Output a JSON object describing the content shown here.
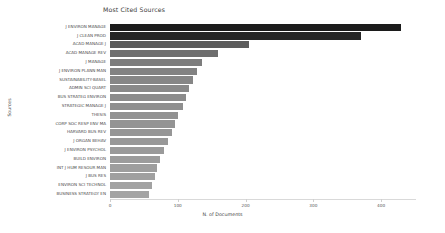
{
  "chart_data": {
    "type": "bar",
    "orientation": "horizontal",
    "title": "Most Cited Sources",
    "xlabel": "N. of Documents",
    "ylabel": "Sources",
    "xlim": [
      0,
      450
    ],
    "grid": false,
    "legend": "none",
    "xticks": [
      0,
      100,
      200,
      300,
      400
    ],
    "xtick_labels": [
      "0",
      "100",
      "200",
      "300",
      "400"
    ],
    "categories": [
      "J ENVIRON MANAGE",
      "J CLEAN PROD",
      "ACAD MANAGE J",
      "ACAD MANAGE REV",
      "J MANAGE",
      "J ENVIRON PLANN MAN",
      "SUSTAINABILITY-BASEL",
      "ADMIN SCI QUART",
      "BUS STRATEG ENVIRON",
      "STRATEGIC MANAGE J",
      "THESIS",
      "CORP SOC RESP ENV MA",
      "HARVARD BUS REV",
      "J ORGAN BEHAV",
      "J ENVIRON PSYCHOL",
      "BUILD ENVIRON",
      "INT J HUM RESOUR MAN",
      "J BUS RES",
      "ENVIRON SCI TECHNOL",
      "BUSINESS STRATEGY EN"
    ],
    "values": [
      430,
      370,
      205,
      160,
      135,
      128,
      122,
      116,
      112,
      108,
      100,
      96,
      92,
      86,
      80,
      74,
      70,
      66,
      62,
      58
    ],
    "bar_colors": [
      "#1c1c1c",
      "#262626",
      "#5c5c5c",
      "#6e6e6e",
      "#7d7d7d",
      "#828282",
      "#868686",
      "#898989",
      "#8c8c8c",
      "#8f8f8f",
      "#929292",
      "#949494",
      "#969696",
      "#989898",
      "#9a9a9a",
      "#9c9c9c",
      "#9e9e9e",
      "#a0a0a0",
      "#a2a2a2",
      "#a4a4a4"
    ]
  }
}
